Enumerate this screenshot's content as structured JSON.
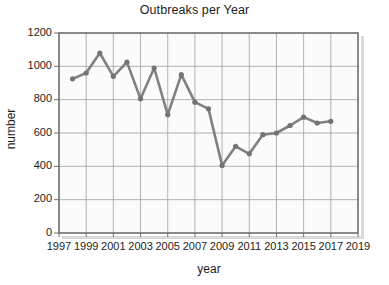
{
  "chart_data": {
    "type": "line",
    "title": "Outbreaks per Year",
    "xlabel": "year",
    "ylabel": "number",
    "grid": true,
    "legend": "none",
    "xlim": [
      1997,
      2019
    ],
    "ylim": [
      0,
      1200
    ],
    "xticks": [
      1997,
      1999,
      2001,
      2003,
      2005,
      2007,
      2009,
      2011,
      2013,
      2015,
      2017,
      2019
    ],
    "yticks": [
      0,
      200,
      400,
      600,
      800,
      1000,
      1200
    ],
    "series": [
      {
        "name": "outbreaks",
        "color": "#808080",
        "marker": "circle",
        "x": [
          1998,
          1999,
          2000,
          2001,
          2002,
          2003,
          2004,
          2005,
          2006,
          2007,
          2008,
          2009,
          2010,
          2011,
          2012,
          2013,
          2014,
          2015,
          2016,
          2017
        ],
        "values": [
          925,
          960,
          1080,
          940,
          1025,
          805,
          990,
          710,
          950,
          785,
          745,
          405,
          520,
          475,
          590,
          600,
          645,
          695,
          660,
          670
        ]
      }
    ]
  },
  "axes": {
    "y_tick_labels": [
      "1200",
      "1000",
      "800",
      "600",
      "400",
      "200",
      "0"
    ],
    "x_tick_labels": [
      "1997",
      "1999",
      "2001",
      "2003",
      "2005",
      "2007",
      "2009",
      "2011",
      "2013",
      "2015",
      "2017",
      "2019"
    ]
  },
  "colors": {
    "line": "#808080",
    "marker": "#737373",
    "grid": "#9aa0a6",
    "frame": "#6e6e6e",
    "plot_background": "#fbfbfb",
    "text": "#1c1c1c"
  }
}
